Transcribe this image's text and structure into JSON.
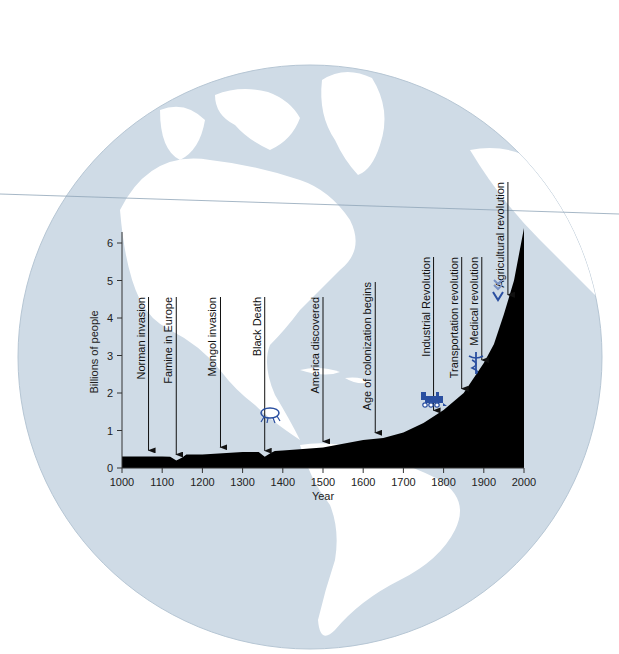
{
  "chart_data": {
    "type": "area",
    "title": "",
    "xlabel": "Year",
    "ylabel": "Billions of people",
    "xlim": [
      1000,
      2000
    ],
    "ylim": [
      0,
      6.5
    ],
    "x_ticks": [
      1000,
      1100,
      1200,
      1300,
      1400,
      1500,
      1600,
      1700,
      1800,
      1900,
      2000
    ],
    "y_ticks": [
      0,
      1,
      2,
      3,
      4,
      5,
      6
    ],
    "grid": false,
    "legend": null,
    "series": [
      {
        "name": "World population",
        "x": [
          1000,
          1100,
          1120,
          1135,
          1150,
          1160,
          1200,
          1300,
          1340,
          1355,
          1370,
          1380,
          1400,
          1500,
          1600,
          1650,
          1700,
          1750,
          1800,
          1850,
          1900,
          1925,
          1950,
          1975,
          2000
        ],
        "values": [
          0.31,
          0.31,
          0.3,
          0.2,
          0.28,
          0.36,
          0.36,
          0.43,
          0.43,
          0.3,
          0.4,
          0.45,
          0.47,
          0.55,
          0.75,
          0.8,
          0.95,
          1.2,
          1.55,
          2.0,
          2.8,
          3.3,
          4.1,
          5.0,
          6.4
        ]
      }
    ],
    "annotations": [
      {
        "label": "Norman invasion",
        "year": 1066,
        "icon": null
      },
      {
        "label": "Famine in Europe",
        "year": 1135,
        "icon": null
      },
      {
        "label": "Mongol invasion",
        "year": 1245,
        "icon": null
      },
      {
        "label": "Black Death",
        "year": 1355,
        "icon": "flea-icon"
      },
      {
        "label": "America discovered",
        "year": 1500,
        "icon": null
      },
      {
        "label": "Age of colonization begins",
        "year": 1630,
        "icon": null
      },
      {
        "label": "Industrial Revolution",
        "year": 1775,
        "icon": "locomotive-icon"
      },
      {
        "label": "Transportation revolution",
        "year": 1845,
        "icon": null
      },
      {
        "label": "Medical revolution",
        "year": 1895,
        "icon": "caduceus-icon"
      },
      {
        "label": "Agricultural revolution",
        "year": 1960,
        "icon": "wheat-icon"
      }
    ]
  },
  "background": {
    "description": "Globe showing the Americas",
    "ocean_color": "#cfdbe6",
    "land_color": "#ffffff"
  },
  "colors": {
    "area_fill": "#000000",
    "axis": "#333333",
    "icon_blue": "#2a4fa0"
  }
}
